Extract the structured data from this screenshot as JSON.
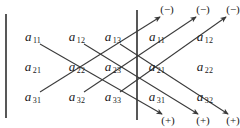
{
  "figure": {
    "line_color": "#3a3a3a",
    "text_color": "#1a1a1a",
    "background": "#ffffff"
  },
  "matrix": {
    "rows": [
      [
        {
          "symbol": "a",
          "subscript": "11",
          "x": 33,
          "y": 38
        },
        {
          "symbol": "a",
          "subscript": "12",
          "x": 77,
          "y": 38
        },
        {
          "symbol": "a",
          "subscript": "13",
          "x": 113,
          "y": 38
        }
      ],
      [
        {
          "symbol": "a",
          "subscript": "21",
          "x": 33,
          "y": 68
        },
        {
          "symbol": "a",
          "subscript": "22",
          "x": 77,
          "y": 68
        },
        {
          "symbol": "a",
          "subscript": "23",
          "x": 113,
          "y": 68
        }
      ],
      [
        {
          "symbol": "a",
          "subscript": "31",
          "x": 33,
          "y": 98
        },
        {
          "symbol": "a",
          "subscript": "32",
          "x": 77,
          "y": 98
        },
        {
          "symbol": "a",
          "subscript": "33",
          "x": 113,
          "y": 98
        }
      ]
    ]
  },
  "repeated_columns": {
    "rows": [
      [
        {
          "symbol": "a",
          "subscript": "11",
          "x": 157,
          "y": 38
        },
        {
          "symbol": "a",
          "subscript": "12",
          "x": 205,
          "y": 38
        }
      ],
      [
        {
          "symbol": "a",
          "subscript": "21",
          "x": 157,
          "y": 68
        },
        {
          "symbol": "a",
          "subscript": "22",
          "x": 205,
          "y": 68
        }
      ],
      [
        {
          "symbol": "a",
          "subscript": "31",
          "x": 157,
          "y": 98
        },
        {
          "symbol": "a",
          "subscript": "32",
          "x": 205,
          "y": 98
        }
      ]
    ]
  },
  "signs": {
    "negative": [
      {
        "label": "(−)",
        "x": 167,
        "y": 9
      },
      {
        "label": "(−)",
        "x": 203,
        "y": 9
      },
      {
        "label": "(−)",
        "x": 233,
        "y": 9
      }
    ],
    "positive": [
      {
        "label": "(+)",
        "x": 168,
        "y": 120
      },
      {
        "label": "(+)",
        "x": 203,
        "y": 120
      },
      {
        "label": "(+)",
        "x": 233,
        "y": 120
      }
    ]
  },
  "bars": [
    {
      "name": "left-bracket-bar",
      "x": 6,
      "y1": 14,
      "y2": 118
    },
    {
      "name": "right-bracket-bar",
      "x": 137,
      "y1": 10,
      "y2": 120
    }
  ],
  "diagonals": {
    "descending": [
      {
        "name": "plus-diagonal-1",
        "x1": 40,
        "y1": 44,
        "x2": 162,
        "y2": 114
      },
      {
        "name": "plus-diagonal-2",
        "x1": 84,
        "y1": 44,
        "x2": 198,
        "y2": 114
      },
      {
        "name": "plus-diagonal-3",
        "x1": 120,
        "y1": 44,
        "x2": 228,
        "y2": 114
      }
    ],
    "ascending": [
      {
        "name": "minus-diagonal-1",
        "x1": 40,
        "y1": 92,
        "x2": 160,
        "y2": 17
      },
      {
        "name": "minus-diagonal-2",
        "x1": 84,
        "y1": 92,
        "x2": 196,
        "y2": 17
      },
      {
        "name": "minus-diagonal-3",
        "x1": 120,
        "y1": 92,
        "x2": 226,
        "y2": 17
      }
    ]
  }
}
